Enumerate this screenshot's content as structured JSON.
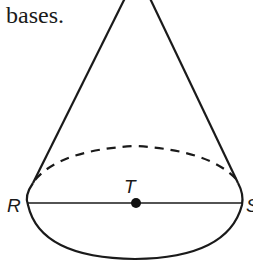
{
  "text": {
    "fragment": "bases."
  },
  "figure": {
    "type": "cone",
    "labels": {
      "left_point": "R",
      "center_point": "T",
      "right_point": "S"
    },
    "colors": {
      "stroke": "#1a1a1a",
      "background": "#ffffff"
    }
  }
}
